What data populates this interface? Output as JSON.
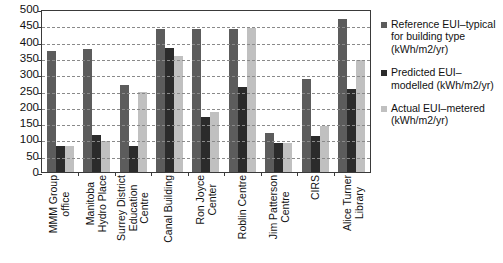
{
  "chart_data": {
    "type": "bar",
    "title": "",
    "xlabel": "",
    "ylabel": "",
    "ylim": [
      0,
      500
    ],
    "yticks": [
      0,
      50,
      100,
      150,
      200,
      250,
      300,
      350,
      400,
      450,
      500
    ],
    "grid": true,
    "legend_position": "right",
    "categories": [
      "MMM Group office",
      "Manitoba Hydro Place",
      "Surrey District Education Centre",
      "Canal Building",
      "Ron Joyce Center",
      "Roblin Centre",
      "Jim Patterson Centre",
      "CIRS",
      "Alice Turner Library"
    ],
    "category_lines": [
      [
        "MMM Group",
        "office"
      ],
      [
        "Manitoba",
        "Hydro Place"
      ],
      [
        "Surrey District",
        "Education",
        "Centre"
      ],
      [
        "Canal Building"
      ],
      [
        "Ron Joyce",
        "Center"
      ],
      [
        "Roblin Centre"
      ],
      [
        "Jim Patterson",
        "Centre"
      ],
      [
        "CIRS"
      ],
      [
        "Alice Turner",
        "Library"
      ]
    ],
    "series": [
      {
        "name": "Reference EUI– typical for building type (kWh/m2/yr)",
        "color": "#5c5c5c",
        "values": [
          372,
          378,
          267,
          440,
          440,
          440,
          120,
          285,
          470
        ]
      },
      {
        "name": "Predicted EUI– modelled (kWh/m2/yr)",
        "color": "#2b2b2b",
        "values": [
          80,
          115,
          80,
          380,
          168,
          262,
          90,
          112,
          255
        ]
      },
      {
        "name": "Actual EUI– metered (kWh/m2/yr)",
        "color": "#c0c0c0",
        "values": [
          80,
          95,
          245,
          355,
          185,
          443,
          88,
          142,
          345
        ]
      }
    ]
  },
  "legend": {
    "items": [
      {
        "label": "Reference EUI–typical for building type (kWh/m2/yr)",
        "color": "#5c5c5c"
      },
      {
        "label": "Predicted EUI–modelled (kWh/m2/yr)",
        "color": "#2b2b2b"
      },
      {
        "label": "Actual EUI–metered (kWh/m2/yr)",
        "color": "#c0c0c0"
      }
    ]
  }
}
